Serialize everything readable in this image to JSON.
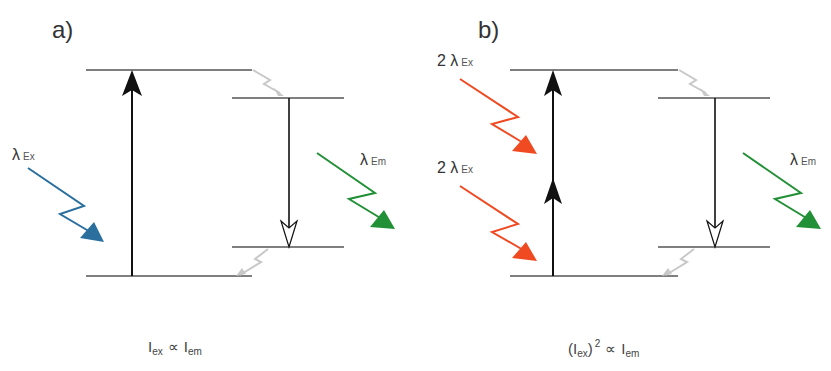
{
  "panels": [
    {
      "id": "a",
      "label": "a)",
      "excitation_labels": [
        {
          "symbol": "λ",
          "subscript": "Ex"
        }
      ],
      "emission_label": {
        "symbol": "λ",
        "subscript": "Em"
      },
      "relation": {
        "left": "I",
        "left_sub": "ex",
        "op": "∝",
        "right": "I",
        "right_sub": "em"
      }
    },
    {
      "id": "b",
      "label": "b)",
      "excitation_labels": [
        {
          "prefix": "2",
          "symbol": "λ",
          "subscript": "Ex"
        },
        {
          "prefix": "2",
          "symbol": "λ",
          "subscript": "Ex"
        }
      ],
      "emission_label": {
        "symbol": "λ",
        "subscript": "Em"
      },
      "relation": {
        "open": "(",
        "left": "I",
        "left_sub": "ex",
        "close": ")",
        "power": "2",
        "op": "∝",
        "right": "I",
        "right_sub": "em"
      }
    }
  ],
  "colors": {
    "excitation_one_photon": "#2a6f9e",
    "excitation_two_photon": "#f04a22",
    "emission": "#229036",
    "levels": "#555555",
    "relaxation": "#c8c8c8",
    "transition": "#111111"
  }
}
